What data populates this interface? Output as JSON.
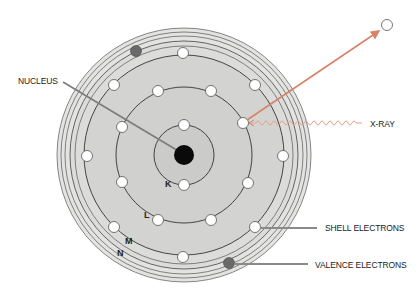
{
  "diagram": {
    "center": [
      184,
      155
    ],
    "nucleus": {
      "label": "NUCLEUS",
      "radius": 10,
      "color": "#0a0a0a"
    },
    "shells": [
      {
        "name": "K",
        "radius": 30
      },
      {
        "name": "L",
        "radius": 68
      },
      {
        "name": "M",
        "radius": 100
      },
      {
        "name": "N",
        "radius": 114
      }
    ],
    "outer_rings": [
      109,
      119,
      123,
      127
    ],
    "labels": {
      "nucleus": "NUCLEUS",
      "xray": "X-RAY",
      "shell_electrons": "SHELL ELECTRONS",
      "valence_electrons": "VALENCE ELECTRONS",
      "shell_k": "K",
      "shell_l": "L",
      "shell_m": "M",
      "shell_n": "N"
    },
    "electrons": {
      "K": [
        [
          184,
          125
        ],
        [
          184,
          185
        ]
      ],
      "L": [
        [
          158,
          91
        ],
        [
          211,
          91
        ],
        [
          243,
          123
        ],
        [
          248,
          183
        ],
        [
          211,
          220
        ],
        [
          158,
          220
        ],
        [
          122,
          182
        ],
        [
          122,
          127
        ]
      ],
      "M": [
        [
          183,
          53
        ],
        [
          255,
          85
        ],
        [
          283,
          156
        ],
        [
          255,
          227
        ],
        [
          183,
          257
        ],
        [
          114,
          227
        ],
        [
          87,
          156
        ],
        [
          114,
          85
        ]
      ],
      "valence": [
        [
          136,
          51
        ],
        [
          229,
          263
        ]
      ]
    },
    "ejected_electron": [
      387,
      25
    ],
    "colors": {
      "disc": "#d3d3d1",
      "inner": "#cdcdcb",
      "outer_band": "#e3e3e1",
      "shell_line": "#3a3a3a",
      "electron_fill": "#ffffff",
      "valence_fill": "#6a6a6a",
      "xray": "#d9826a",
      "leader": "#7d7d7d"
    }
  }
}
